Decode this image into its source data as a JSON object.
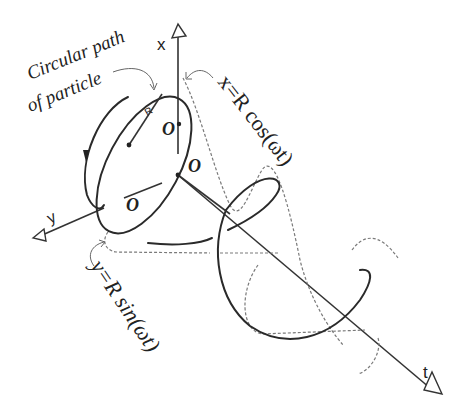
{
  "diagram": {
    "labels": {
      "circular_path_line1": "Circular path",
      "circular_path_line2": "of particle",
      "x_axis": "x",
      "y_axis": "y",
      "t_axis": "t",
      "radius": "R",
      "origin_1": "O",
      "origin_2": "O",
      "origin_3": "O",
      "x_equation": "x=R cos(ωt)",
      "y_equation": "y=R sin(ωt)"
    },
    "colors": {
      "stroke": "#2a2a2a",
      "dashed": "#7a7a7a",
      "background": "#ffffff"
    }
  }
}
